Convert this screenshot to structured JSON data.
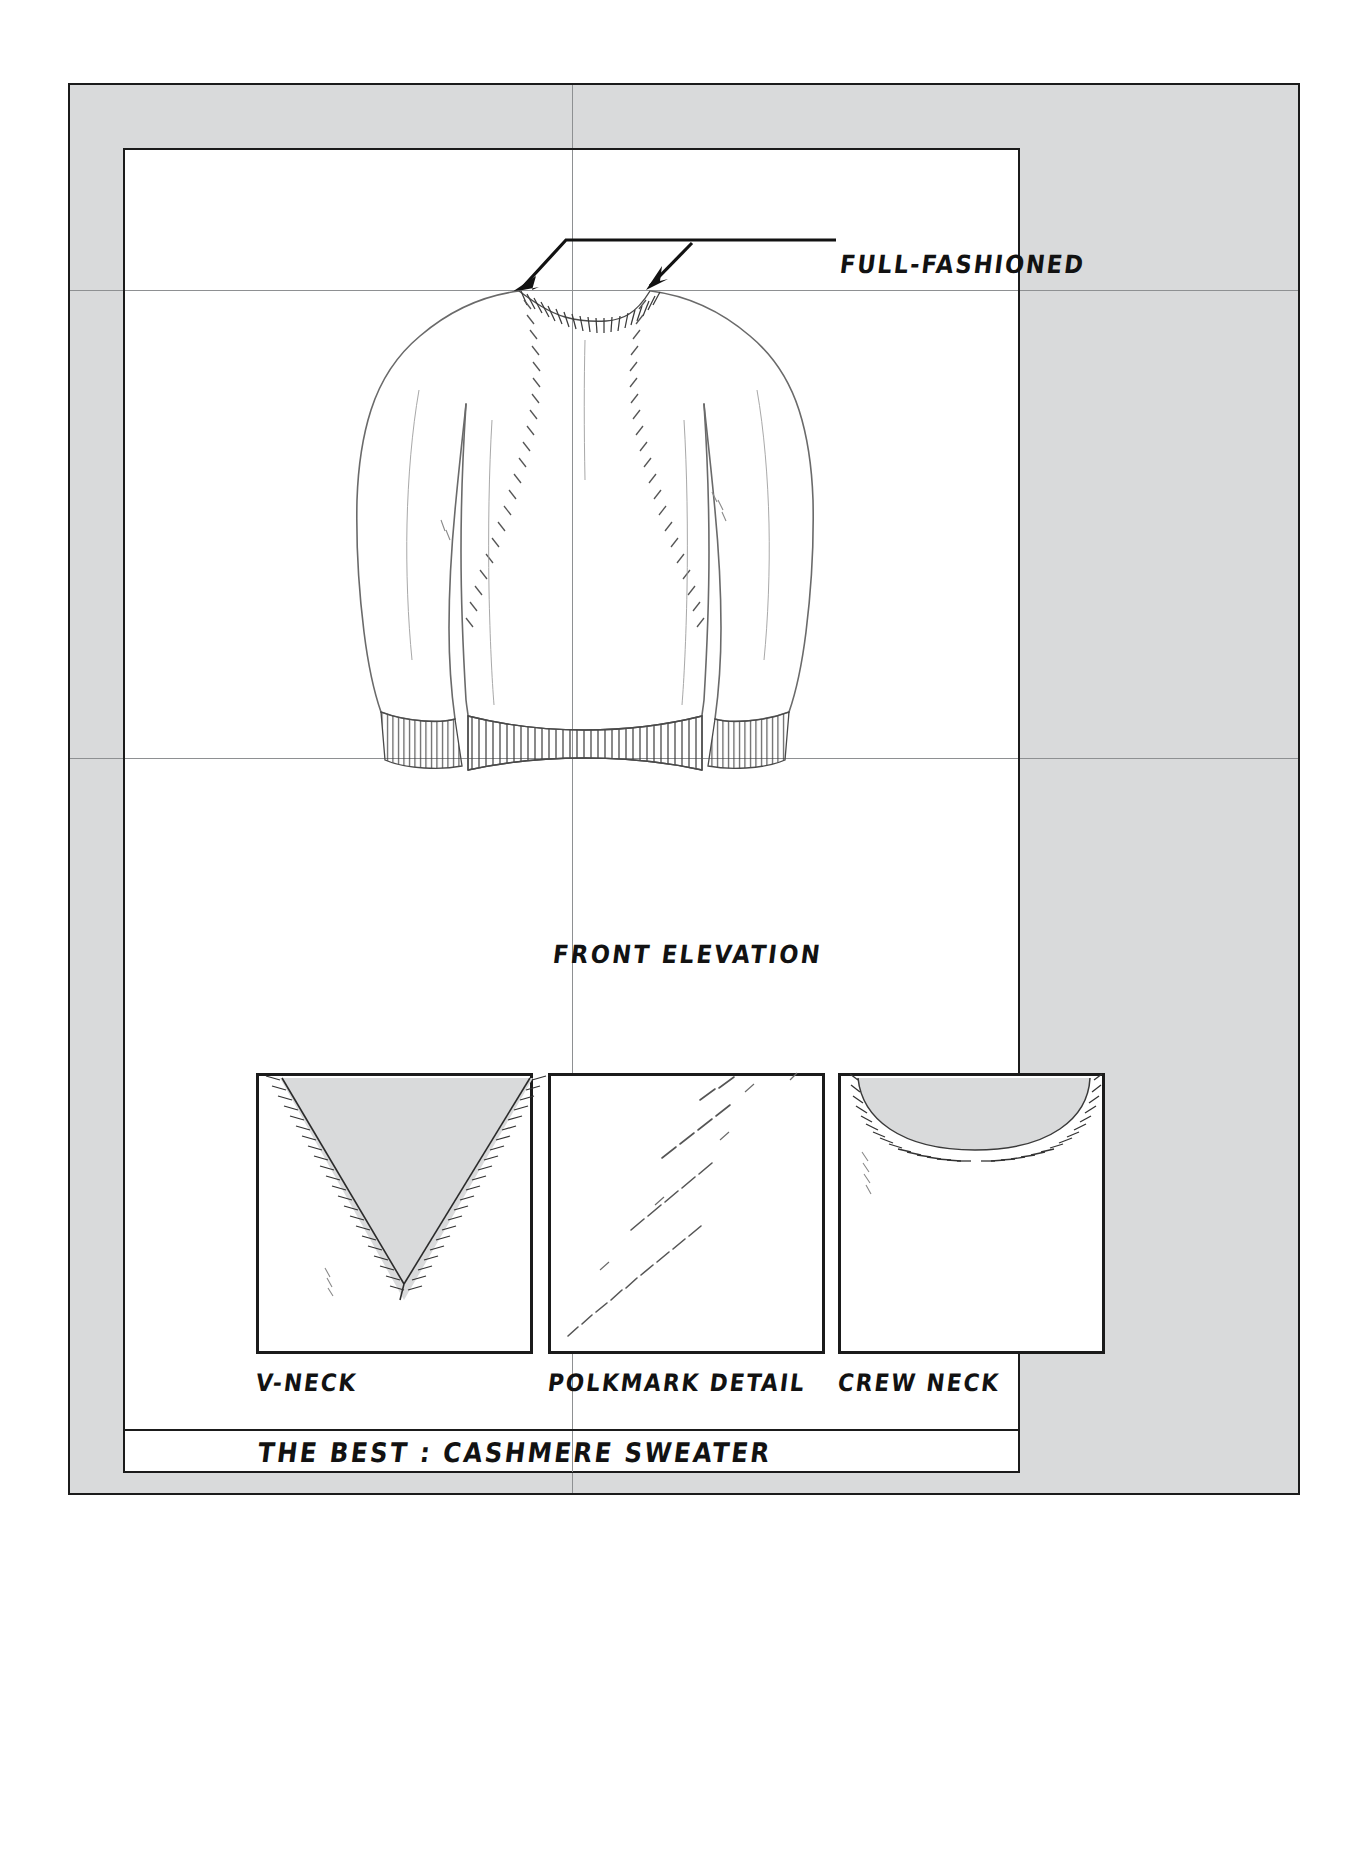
{
  "sheet": {
    "background_color": "#ffffff",
    "mount_color": "#d9dadb",
    "panel_color": "#ffffff",
    "ink_color": "#1b1b1b",
    "guide_color": "#8e9092",
    "shade_color": "#d9dadb"
  },
  "annotations": {
    "full_fashioned": "FULL-FASHIONED"
  },
  "captions": {
    "front_elevation": "FRONT ELEVATION",
    "v_neck": "V-NECK",
    "polkmark_detail": "POLKMARK DETAIL",
    "crew_neck": "CREW NECK"
  },
  "title_plate": {
    "text": "THE BEST : CASHMERE SWEATER"
  },
  "detail_boxes": [
    {
      "name": "v-neck",
      "caption": "V-NECK"
    },
    {
      "name": "polkmark-detail",
      "caption": "POLKMARK DETAIL"
    },
    {
      "name": "crew-neck",
      "caption": "CREW NECK"
    }
  ],
  "guides": {
    "vertical": [
      572
    ],
    "horizontal": [
      290,
      758
    ]
  }
}
